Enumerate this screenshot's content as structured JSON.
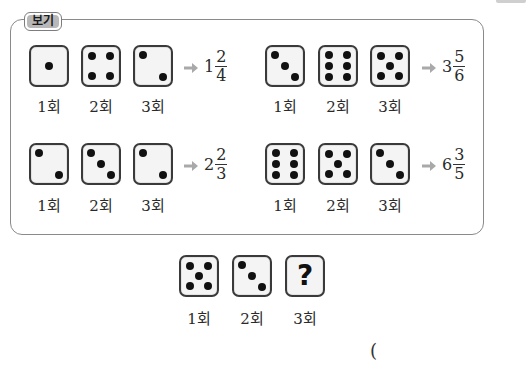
{
  "example": {
    "label": "보기",
    "groups": [
      {
        "trials": [
          1,
          4,
          2
        ],
        "labels": [
          "1회",
          "2회",
          "3회"
        ],
        "result": {
          "whole": "1",
          "numerator": "2",
          "denominator": "4"
        }
      },
      {
        "trials": [
          3,
          6,
          5
        ],
        "labels": [
          "1회",
          "2회",
          "3회"
        ],
        "result": {
          "whole": "3",
          "numerator": "5",
          "denominator": "6"
        }
      },
      {
        "trials": [
          2,
          3,
          2
        ],
        "labels": [
          "1회",
          "2회",
          "3회"
        ],
        "result": {
          "whole": "2",
          "numerator": "2",
          "denominator": "3"
        }
      },
      {
        "trials": [
          6,
          5,
          3
        ],
        "labels": [
          "1회",
          "2회",
          "3회"
        ],
        "result": {
          "whole": "6",
          "numerator": "3",
          "denominator": "5"
        }
      }
    ]
  },
  "question": {
    "trials": [
      5,
      3,
      "?"
    ],
    "labels": [
      "1회",
      "2회",
      "3회"
    ],
    "unknown_symbol": "?",
    "answer_paren": "("
  },
  "colors": {
    "arrow": "#a9a9a9",
    "label_badge": "#b8b8b8",
    "box_border": "#8a8a8a",
    "die_border": "#3a3a3a",
    "die_face": "#f4f4f4"
  }
}
